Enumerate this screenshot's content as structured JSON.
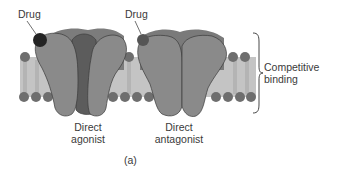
{
  "diagram": {
    "drug_labels": [
      "Drug",
      "Drug"
    ],
    "receptors": [
      {
        "label_line1": "Direct",
        "label_line2": "agonist"
      },
      {
        "label_line1": "Direct",
        "label_line2": "antagonist"
      }
    ],
    "brace_label_line1": "Competitive",
    "brace_label_line2": "binding",
    "panel_label": "(a)"
  },
  "colors": {
    "membrane_head": "#707070",
    "membrane_fill": "#bdbdbd",
    "protein_light": "#8a8a8a",
    "protein_mid": "#7a7a7a",
    "protein_dark": "#5e5e5e",
    "drug_agonist": "#2a2a2a",
    "drug_antagonist": "#555555"
  }
}
